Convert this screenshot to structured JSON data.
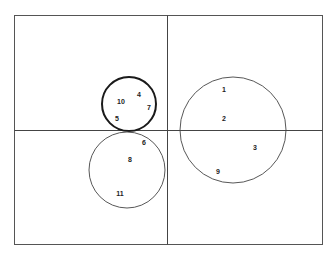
{
  "diagram": {
    "type": "cluster-diagram",
    "colors": {
      "background": "#ffffff",
      "frame": "#555555",
      "axis": "#444444",
      "circle_thin": "#444444",
      "circle_bold": "#1a1a1a",
      "label": "#222222"
    },
    "frame": {
      "x": 14,
      "y": 15,
      "width": 308,
      "height": 229
    },
    "axes": {
      "vertical_x": 167,
      "horizontal_y": 130
    },
    "circles": [
      {
        "id": "cluster-upper-left",
        "cx": 129,
        "cy": 104,
        "r": 27,
        "bold": true,
        "members": [
          "4",
          "5",
          "7",
          "10"
        ]
      },
      {
        "id": "cluster-lower-left",
        "cx": 127,
        "cy": 170,
        "r": 38,
        "bold": false,
        "members": [
          "6",
          "8",
          "11"
        ]
      },
      {
        "id": "cluster-right",
        "cx": 233,
        "cy": 130,
        "r": 53,
        "bold": false,
        "members": [
          "1",
          "2",
          "3",
          "9"
        ]
      }
    ],
    "points": [
      {
        "label": "1",
        "x": 224,
        "y": 89
      },
      {
        "label": "2",
        "x": 224,
        "y": 118
      },
      {
        "label": "3",
        "x": 255,
        "y": 147
      },
      {
        "label": "4",
        "x": 139,
        "y": 94
      },
      {
        "label": "5",
        "x": 117,
        "y": 118
      },
      {
        "label": "6",
        "x": 144,
        "y": 142
      },
      {
        "label": "7",
        "x": 149,
        "y": 107
      },
      {
        "label": "8",
        "x": 130,
        "y": 159
      },
      {
        "label": "9",
        "x": 218,
        "y": 171
      },
      {
        "label": "10",
        "x": 121,
        "y": 101
      },
      {
        "label": "11",
        "x": 120,
        "y": 193
      }
    ]
  }
}
